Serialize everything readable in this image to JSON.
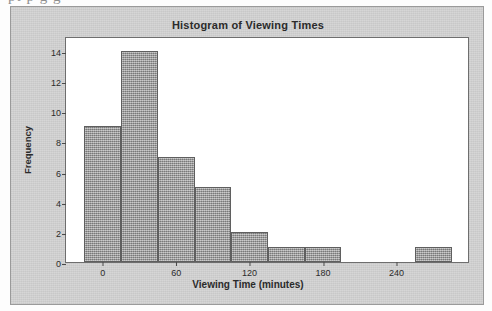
{
  "page": {
    "cut_off_text_above": "pt p  g g"
  },
  "figure": {
    "title": "Histogram of Viewing Times",
    "x_axis_label": "Viewing Time (minutes)",
    "y_axis_label": "Frequency",
    "bar_fill_color": "#9d9d9d",
    "bar_edge_color": "#5f5f5f",
    "background_color": "#d4d4d4",
    "plot_background_color": "#ffffff"
  },
  "chart_data": {
    "type": "bar",
    "title": "Histogram of Viewing Times",
    "xlabel": "Viewing Time (minutes)",
    "ylabel": "Frequency",
    "xlim": [
      -30,
      300
    ],
    "ylim": [
      0,
      15
    ],
    "grid": false,
    "legend": null,
    "bin_width": 30,
    "x_ticks": [
      0,
      60,
      120,
      180,
      240
    ],
    "y_ticks": [
      0,
      2,
      4,
      6,
      8,
      10,
      12,
      14
    ],
    "bins": [
      {
        "left": -15,
        "right": 15,
        "value": 9
      },
      {
        "left": 15,
        "right": 45,
        "value": 14
      },
      {
        "left": 45,
        "right": 75,
        "value": 7
      },
      {
        "left": 75,
        "right": 105,
        "value": 5
      },
      {
        "left": 105,
        "right": 135,
        "value": 2
      },
      {
        "left": 135,
        "right": 165,
        "value": 1
      },
      {
        "left": 165,
        "right": 195,
        "value": 1
      },
      {
        "left": 195,
        "right": 225,
        "value": 0
      },
      {
        "left": 225,
        "right": 255,
        "value": 0
      },
      {
        "left": 255,
        "right": 285,
        "value": 1
      }
    ],
    "categories": [
      "-15 to 15",
      "15 to 45",
      "45 to 75",
      "75 to 105",
      "105 to 135",
      "135 to 165",
      "165 to 195",
      "195 to 225",
      "225 to 255",
      "255 to 285"
    ],
    "values": [
      9,
      14,
      7,
      5,
      2,
      1,
      1,
      0,
      0,
      1
    ]
  }
}
